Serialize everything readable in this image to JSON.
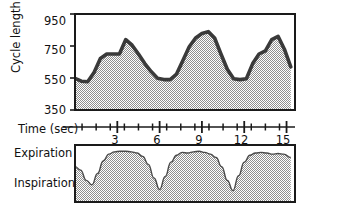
{
  "figure": {
    "title": "",
    "panels": [
      "cycle-length-panel",
      "respiration-panel"
    ]
  },
  "axes": {
    "y_label": "Cycle length (msec)",
    "y_ticks": [
      "950",
      "750",
      "550",
      "350"
    ],
    "x_label": "Time (sec)",
    "x_ticks": [
      "3",
      "6",
      "9",
      "12",
      "15"
    ]
  },
  "respiration": {
    "top_label": "Expiration",
    "bottom_label": "Inspiration"
  },
  "colors": {
    "line": "#3a3a3a",
    "fill": "#b4b4b4",
    "frame": "#1a1a1a",
    "background": "#ffffff"
  },
  "chart_data": {
    "type": "area",
    "xlabel": "Time (sec)",
    "ylabel": "Cycle length (msec)",
    "xlim": [
      0,
      15.6
    ],
    "ylim": [
      350,
      950
    ],
    "ytick_values": [
      950,
      750,
      550,
      350
    ],
    "xtick_values": [
      3,
      6,
      9,
      12,
      15
    ],
    "xtick_minor_values": [
      0.5,
      1.5,
      2.5,
      3.5,
      4.5,
      5.5,
      6.5,
      7.5,
      8.5,
      9.5,
      10.5,
      11.5,
      12.5,
      13.5,
      14.5
    ],
    "grid": false,
    "legend": null,
    "series": [
      {
        "name": "Cycle length",
        "x": [
          0.0,
          0.45,
          0.9,
          1.35,
          1.8,
          2.25,
          2.7,
          3.15,
          3.6,
          4.05,
          4.5,
          4.95,
          5.4,
          5.85,
          6.3,
          6.75,
          7.2,
          7.65,
          8.1,
          8.55,
          9.0,
          9.45,
          9.9,
          10.35,
          10.8,
          11.25,
          11.7,
          12.15,
          12.6,
          13.05,
          13.5,
          13.95,
          14.4,
          14.85,
          15.3
        ],
        "y": [
          548,
          530,
          527,
          585,
          672,
          700,
          700,
          700,
          790,
          755,
          700,
          640,
          590,
          548,
          540,
          540,
          575,
          660,
          745,
          800,
          828,
          840,
          800,
          700,
          605,
          545,
          540,
          545,
          640,
          700,
          720,
          790,
          810,
          730,
          620
        ],
        "units": "msec"
      }
    ]
  },
  "respiration_data": {
    "type": "area",
    "title": "Respiration trace",
    "top_label": "Expiration",
    "bottom_label": "Inspiration",
    "x": [
      0.0,
      0.4,
      0.8,
      1.2,
      1.6,
      2.0,
      2.4,
      2.8,
      3.2,
      3.6,
      4.0,
      4.4,
      4.8,
      5.2,
      5.6,
      6.0,
      6.4,
      6.8,
      7.2,
      7.6,
      8.0,
      8.4,
      8.8,
      9.2,
      9.6,
      10.0,
      10.4,
      10.8,
      11.2,
      11.6,
      12.0,
      12.4,
      12.8,
      13.2,
      13.6,
      14.0,
      14.4,
      14.8,
      15.3
    ],
    "y": [
      0.62,
      0.56,
      0.38,
      0.3,
      0.5,
      0.72,
      0.84,
      0.88,
      0.89,
      0.89,
      0.88,
      0.86,
      0.8,
      0.66,
      0.42,
      0.22,
      0.45,
      0.7,
      0.82,
      0.87,
      0.86,
      0.88,
      0.89,
      0.87,
      0.84,
      0.78,
      0.62,
      0.38,
      0.2,
      0.46,
      0.7,
      0.82,
      0.86,
      0.87,
      0.86,
      0.84,
      0.85,
      0.84,
      0.78
    ]
  }
}
